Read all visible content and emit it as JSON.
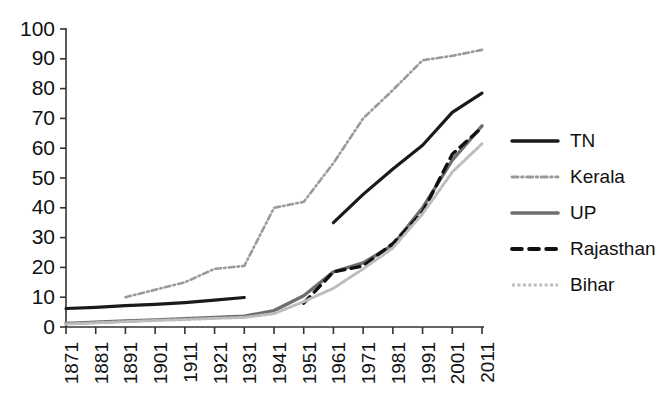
{
  "chart_data": {
    "type": "line",
    "title": "",
    "subtitle": "",
    "xlabel": "",
    "ylabel": "",
    "xlim": [
      1871,
      2011
    ],
    "ylim": [
      0,
      100
    ],
    "yticks": [
      0,
      10,
      20,
      30,
      40,
      50,
      60,
      70,
      80,
      90,
      100
    ],
    "categories": [
      "1871",
      "1881",
      "1891",
      "1901",
      "1911",
      "1921",
      "1931",
      "1941",
      "1951",
      "1961",
      "1971",
      "1981",
      "1991",
      "2001",
      "2011"
    ],
    "grid": false,
    "legend_position": "right",
    "series": [
      {
        "name": "TN",
        "color": "#1a1a1a",
        "style": "solid",
        "width": 3.2,
        "x": [
          "1871",
          "1881",
          "1891",
          "1901",
          "1911",
          "1921",
          "1931"
        ],
        "values": [
          6.2,
          6.6,
          7.2,
          7.6,
          8.2,
          9.0,
          9.9
        ]
      },
      {
        "name": "TN",
        "color": "#1a1a1a",
        "style": "solid",
        "width": 3.2,
        "x": [
          "1961",
          "1971",
          "1981",
          "1991",
          "2001",
          "2011"
        ],
        "values": [
          35.0,
          44.5,
          53.0,
          61.0,
          72.0,
          78.5
        ]
      },
      {
        "name": "Kerala",
        "color": "#9a9a9a",
        "style": "dashdot",
        "width": 2.6,
        "x": [
          "1891",
          "1901",
          "1911",
          "1921",
          "1931",
          "1941",
          "1951",
          "1961",
          "1971",
          "1981",
          "1991",
          "2001",
          "2011"
        ],
        "values": [
          10.0,
          12.5,
          15.0,
          19.5,
          20.5,
          40.0,
          42.0,
          55.0,
          70.0,
          79.5,
          89.5,
          91.0,
          93.0
        ]
      },
      {
        "name": "UP",
        "color": "#6e6e6e",
        "style": "solid",
        "width": 3.4,
        "x": [
          "1871",
          "1881",
          "1891",
          "1901",
          "1911",
          "1921",
          "1931",
          "1941",
          "1951",
          "1961",
          "1971",
          "1981",
          "1991",
          "2001",
          "2011"
        ],
        "values": [
          1.2,
          1.6,
          2.0,
          2.4,
          2.8,
          3.2,
          3.6,
          5.5,
          10.5,
          18.5,
          21.5,
          27.5,
          40.0,
          56.0,
          67.5
        ]
      },
      {
        "name": "Rajasthan",
        "color": "#111111",
        "style": "dashed",
        "width": 3.4,
        "x": [
          "1951",
          "1961",
          "1971",
          "1981",
          "1991",
          "2001",
          "2011"
        ],
        "values": [
          8.0,
          18.5,
          20.5,
          28.0,
          38.5,
          58.0,
          67.0
        ]
      },
      {
        "name": "Bihar",
        "color": "#bdbdbd",
        "style": "dotted",
        "width": 3.0,
        "x": [
          "1871",
          "1881",
          "1891",
          "1901",
          "1911",
          "1921",
          "1931",
          "1941",
          "1951",
          "1961",
          "1971",
          "1981",
          "1991",
          "2001",
          "2011"
        ],
        "values": [
          1.0,
          1.4,
          1.8,
          2.2,
          2.5,
          2.9,
          3.2,
          4.5,
          8.5,
          13.0,
          19.5,
          26.5,
          38.0,
          52.0,
          61.5
        ]
      }
    ]
  },
  "legend": {
    "items": [
      {
        "label": "TN",
        "color": "#1a1a1a",
        "style": "solid",
        "width": 3.4
      },
      {
        "label": "Kerala",
        "color": "#9a9a9a",
        "style": "dashdot",
        "width": 2.8
      },
      {
        "label": "UP",
        "color": "#6e6e6e",
        "style": "solid",
        "width": 3.6
      },
      {
        "label": "Rajasthan",
        "color": "#111111",
        "style": "dashed",
        "width": 3.8
      },
      {
        "label": "Bihar",
        "color": "#bdbdbd",
        "style": "dotted",
        "width": 3.2
      }
    ]
  },
  "axes": {
    "y_tick_labels": [
      "0",
      "10",
      "20",
      "30",
      "40",
      "50",
      "60",
      "70",
      "80",
      "90",
      "100"
    ],
    "x_tick_labels": [
      "1871",
      "1881",
      "1891",
      "1901",
      "1911",
      "1921",
      "1931",
      "1941",
      "1951",
      "1961",
      "1971",
      "1981",
      "1991",
      "2001",
      "2011"
    ]
  },
  "colors": {
    "axis": "#333333",
    "text": "#111111",
    "background": "#ffffff"
  }
}
